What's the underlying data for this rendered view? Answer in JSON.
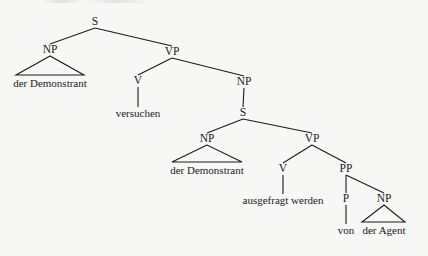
{
  "diagram": {
    "type": "syntax-tree",
    "edge_color": "#1b1b1b",
    "background": "#f7f7f5",
    "nodes": {
      "s_root": {
        "label": "S",
        "x": 95,
        "y": 22
      },
      "np_1": {
        "label": "NP",
        "x": 50,
        "y": 50
      },
      "np_1_leaf": {
        "label": "der Demonstrant",
        "x": 50,
        "y": 83
      },
      "vp_1": {
        "label": "VP",
        "x": 172,
        "y": 52
      },
      "v_1": {
        "label": "V",
        "x": 138,
        "y": 81
      },
      "v_1_leaf": {
        "label": "versuchen",
        "x": 138,
        "y": 113
      },
      "np_2": {
        "label": "NP",
        "x": 244,
        "y": 82
      },
      "s_2": {
        "label": "S",
        "x": 243,
        "y": 113
      },
      "np_3": {
        "label": "NP",
        "x": 207,
        "y": 139
      },
      "np_3_leaf": {
        "label": "der Demonstrant",
        "x": 207,
        "y": 170
      },
      "vp_2": {
        "label": "VP",
        "x": 312,
        "y": 139
      },
      "v_2": {
        "label": "V",
        "x": 283,
        "y": 169
      },
      "v_2_leaf": {
        "label": "ausgefragt werden",
        "x": 283,
        "y": 200
      },
      "pp": {
        "label": "PP",
        "x": 346,
        "y": 169
      },
      "p": {
        "label": "P",
        "x": 346,
        "y": 199
      },
      "p_leaf": {
        "label": "von",
        "x": 346,
        "y": 230
      },
      "np_4": {
        "label": "NP",
        "x": 384,
        "y": 199
      },
      "np_4_leaf": {
        "label": "der Agent",
        "x": 384,
        "y": 230
      }
    },
    "edges": [
      [
        "s_root",
        "np_1"
      ],
      [
        "s_root",
        "vp_1"
      ],
      [
        "vp_1",
        "v_1"
      ],
      [
        "vp_1",
        "np_2"
      ],
      [
        "v_1",
        "v_1_leaf"
      ],
      [
        "np_2",
        "s_2"
      ],
      [
        "s_2",
        "np_3"
      ],
      [
        "s_2",
        "vp_2"
      ],
      [
        "vp_2",
        "v_2"
      ],
      [
        "vp_2",
        "pp"
      ],
      [
        "v_2",
        "v_2_leaf"
      ],
      [
        "pp",
        "p"
      ],
      [
        "pp",
        "np_4"
      ],
      [
        "p",
        "p_leaf"
      ]
    ],
    "triangles": [
      {
        "parent": "np_1",
        "left": 16,
        "right": 84,
        "base_y": 75
      },
      {
        "parent": "np_3",
        "left": 172,
        "right": 242,
        "base_y": 162
      },
      {
        "parent": "np_4",
        "left": 362,
        "right": 405,
        "base_y": 222
      }
    ]
  }
}
